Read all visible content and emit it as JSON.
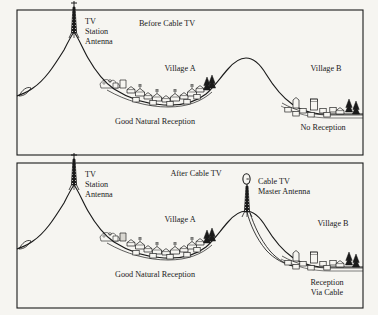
{
  "figure": {
    "type": "technical-illustration",
    "background_color": "#f6f5f1",
    "ink_color": "#1a1a1a",
    "width": 378,
    "height": 315
  },
  "panels": [
    {
      "id": "before",
      "title": "Before Cable TV",
      "frame": {
        "x": 17,
        "y": 10,
        "w": 346,
        "h": 145
      },
      "labels": {
        "antenna": {
          "line1": "TV",
          "line2": "Station",
          "line3": "Antenna"
        },
        "village_a": "Village A",
        "village_b": "Village B",
        "reception_left": "Good Natural Reception",
        "reception_right": "No Reception"
      },
      "elements": {
        "tv_station_antenna": "lattice-tower",
        "mountain_left": "tall peak with antenna on summit",
        "mountain_right": "rounded hill blocking line of sight",
        "village_a_houses": 14,
        "village_b_buildings": 11,
        "pine_trees": 5,
        "cable_run": "none"
      }
    },
    {
      "id": "after",
      "title": "After Cable TV",
      "frame": {
        "x": 17,
        "y": 163,
        "w": 346,
        "h": 145
      },
      "labels": {
        "antenna": {
          "line1": "TV",
          "line2": "Station",
          "line3": "Antenna"
        },
        "master_antenna": {
          "line1": "Cable TV",
          "line2": "Master Antenna"
        },
        "village_a": "Village A",
        "village_b": "Village B",
        "reception_left": "Good Natural Reception",
        "reception_right_line1": "Reception",
        "reception_right_line2": "Via Cable"
      },
      "elements": {
        "tv_station_antenna": "lattice-tower",
        "cable_tv_master_antenna": "lattice-tower-with-dish",
        "mountain_left": "tall peak with antenna on summit",
        "mountain_right": "rounded hill with master antenna on summit",
        "village_a_houses": 14,
        "village_b_buildings": 11,
        "pine_trees": 6,
        "cable_run": "double line from master antenna down hillside to Village B"
      }
    }
  ]
}
